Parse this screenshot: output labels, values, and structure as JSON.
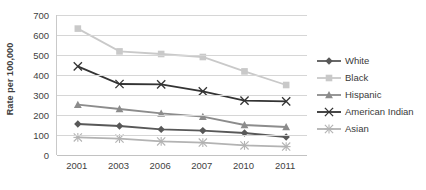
{
  "chart_data": {
    "type": "line",
    "title": "",
    "xlabel": "",
    "ylabel": "Rate per 100,000",
    "categories": [
      "2001",
      "2003",
      "2006",
      "2007",
      "2010",
      "2011"
    ],
    "ylim": [
      0,
      700
    ],
    "ytick_step": 100,
    "yticks": [
      "700",
      "600",
      "500",
      "400",
      "300",
      "200",
      "100",
      "0"
    ],
    "grid": true,
    "legend_position": "right",
    "series": [
      {
        "name": "White",
        "color": "#585858",
        "marker": "diamond",
        "values": [
          155,
          145,
          128,
          122,
          110,
          90
        ]
      },
      {
        "name": "Black",
        "color": "#c9c9c9",
        "marker": "square",
        "values": [
          632,
          518,
          505,
          490,
          418,
          350
        ]
      },
      {
        "name": "Hispanic",
        "color": "#8c8c8c",
        "marker": "triangle",
        "values": [
          252,
          230,
          208,
          192,
          150,
          140
        ]
      },
      {
        "name": "American Indian",
        "color": "#333333",
        "marker": "x",
        "values": [
          443,
          355,
          353,
          318,
          272,
          268
        ]
      },
      {
        "name": "Asian",
        "color": "#b3b3b3",
        "marker": "asterisk",
        "values": [
          88,
          82,
          68,
          62,
          48,
          42
        ]
      }
    ]
  },
  "legend": {
    "items": [
      {
        "label": "White"
      },
      {
        "label": "Black"
      },
      {
        "label": "Hispanic"
      },
      {
        "label": "American Indian"
      },
      {
        "label": "Asian"
      }
    ]
  }
}
